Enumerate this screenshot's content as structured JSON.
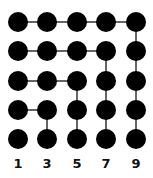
{
  "diagram": {
    "grid": {
      "rows": 5,
      "cols": 5
    },
    "dot_color": "#000000",
    "line_color": "#333333",
    "labels": [
      "1",
      "3",
      "5",
      "7",
      "9"
    ],
    "gnomons": [
      {
        "label": "1",
        "dots": 1
      },
      {
        "label": "3",
        "dots": 3
      },
      {
        "label": "5",
        "dots": 5
      },
      {
        "label": "7",
        "dots": 7
      },
      {
        "label": "9",
        "dots": 9
      }
    ]
  }
}
